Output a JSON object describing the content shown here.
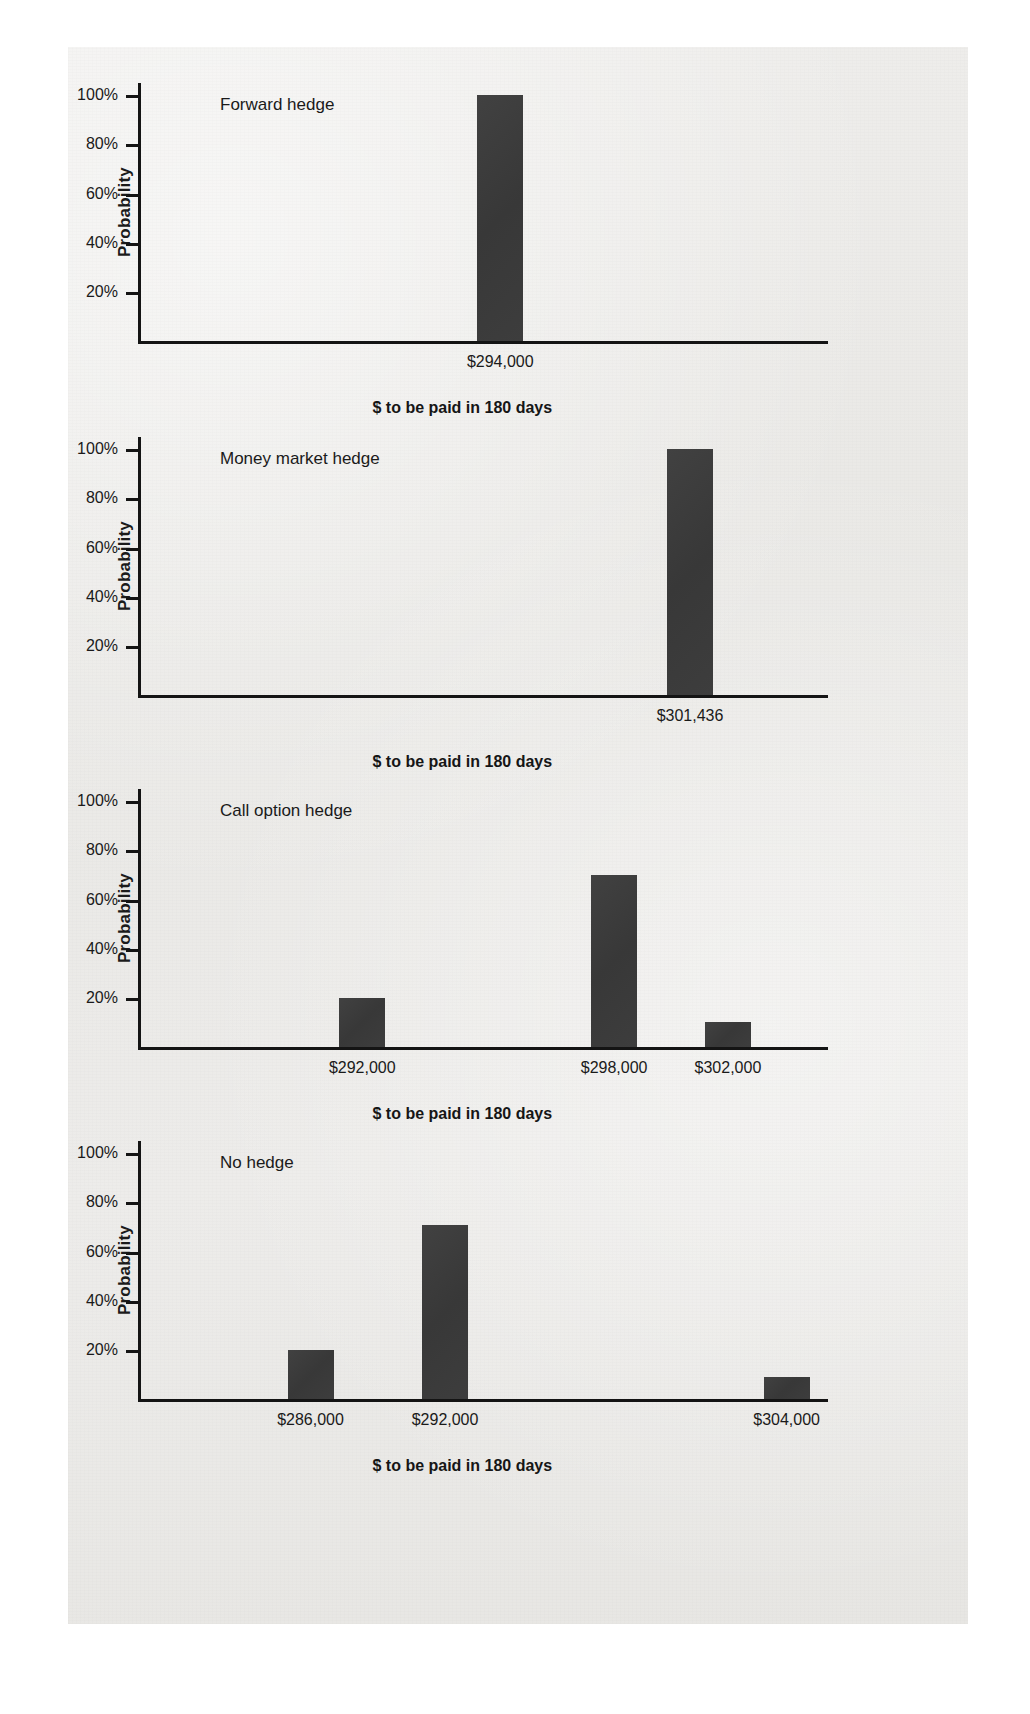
{
  "document": {
    "kind": "textbook-figure-plate",
    "background_color": "#ecebe9",
    "bar_color": "#3b3b3b",
    "axis_color": "#141414",
    "text_color": "#1a1a1a"
  },
  "shared": {
    "ylabel": "Probability",
    "xaxis_title": "$ to be paid in 180 days",
    "ytick_labels": [
      "100%",
      "80%",
      "60%",
      "40%",
      "20%"
    ],
    "ytick_values": [
      100,
      80,
      60,
      40,
      20
    ]
  },
  "chart_data": [
    {
      "type": "bar",
      "title": "Forward hedge",
      "categories": [
        "$294,000"
      ],
      "values": [
        100
      ],
      "xlabel": "$ to be paid in 180 days",
      "ylabel": "Probability",
      "ylim": [
        0,
        105
      ],
      "yticks": [
        20,
        40,
        60,
        80,
        100
      ],
      "ytick_labels": [
        "20%",
        "40%",
        "60%",
        "80%",
        "100%"
      ],
      "grid": false,
      "legend": "none",
      "bar_positions_pct": [
        52.5
      ]
    },
    {
      "type": "bar",
      "title": "Money market hedge",
      "categories": [
        "$301,436"
      ],
      "values": [
        100
      ],
      "xlabel": "$ to be paid in 180 days",
      "ylabel": "Probability",
      "ylim": [
        0,
        105
      ],
      "yticks": [
        20,
        40,
        60,
        80,
        100
      ],
      "ytick_labels": [
        "20%",
        "40%",
        "60%",
        "80%",
        "100%"
      ],
      "grid": false,
      "legend": "none",
      "bar_positions_pct": [
        80.0
      ]
    },
    {
      "type": "bar",
      "title": "Call option hedge",
      "categories": [
        "$292,000",
        "$298,000",
        "$302,000"
      ],
      "values": [
        20,
        70,
        10
      ],
      "xlabel": "$ to be paid in 180 days",
      "ylabel": "Probability",
      "ylim": [
        0,
        105
      ],
      "yticks": [
        20,
        40,
        60,
        80,
        100
      ],
      "ytick_labels": [
        "20%",
        "40%",
        "60%",
        "80%",
        "100%"
      ],
      "grid": false,
      "legend": "none",
      "bar_positions_pct": [
        32.5,
        69.0,
        85.5
      ]
    },
    {
      "type": "bar",
      "title": "No hedge",
      "categories": [
        "$286,000",
        "$292,000",
        "$304,000"
      ],
      "values": [
        20,
        71,
        9
      ],
      "xlabel": "$ to be paid in 180 days",
      "ylabel": "Probability",
      "ylim": [
        0,
        105
      ],
      "yticks": [
        20,
        40,
        60,
        80,
        100
      ],
      "ytick_labels": [
        "20%",
        "40%",
        "60%",
        "80%",
        "100%"
      ],
      "grid": false,
      "legend": "none",
      "bar_positions_pct": [
        25.0,
        44.5,
        94.0
      ]
    }
  ]
}
